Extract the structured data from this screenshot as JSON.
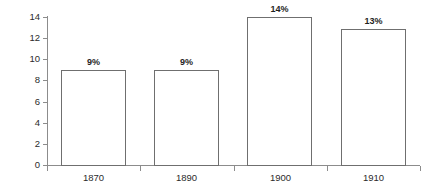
{
  "chart_data": {
    "type": "bar",
    "title": "",
    "subtitle": "",
    "xlabel": "",
    "ylabel": "% GNP",
    "categories": [
      "1870",
      "1890",
      "1900",
      "1910"
    ],
    "values": [
      9,
      9,
      14,
      12.85
    ],
    "data_labels": [
      "9%",
      "9%",
      "14%",
      "13%"
    ],
    "ylim": [
      0,
      14
    ],
    "yticks": [
      0,
      2,
      4,
      6,
      8,
      10,
      12,
      14
    ],
    "ytick_labels": [
      "0",
      "2",
      "4",
      "6",
      "8",
      "10",
      "12",
      "14"
    ],
    "grid": false,
    "legend": null,
    "legend_position": "none",
    "bar_fill_color": "#ffffff",
    "bar_border_color": "#6f6f6f",
    "axis_color": "#8c8c8c",
    "text_color": "#2b2b2b",
    "background_color": "#ffffff"
  }
}
